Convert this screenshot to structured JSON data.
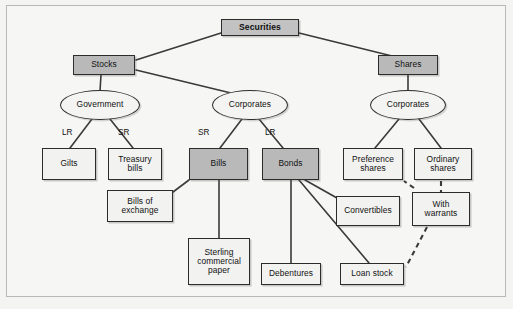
{
  "figure": {
    "background_color": "#f4f4f2",
    "frame_color": "#b9b9b4",
    "shaded_fill": "#b9b9b9",
    "plain_fill": "#f2f2f0",
    "line_color": "#3a3a3a"
  },
  "nodes": {
    "securities": {
      "label": "Securities",
      "shape": "box",
      "style": "shaded-bold",
      "x": 221,
      "y": 19,
      "w": 78,
      "h": 17
    },
    "stocks": {
      "label": "Stocks",
      "shape": "box",
      "style": "shaded",
      "x": 73,
      "y": 55,
      "w": 62,
      "h": 20
    },
    "shares": {
      "label": "Shares",
      "shape": "box",
      "style": "shaded",
      "x": 378,
      "y": 55,
      "w": 60,
      "h": 20
    },
    "government": {
      "label": "Government",
      "shape": "ellipse",
      "style": "plain",
      "x": 60,
      "y": 90,
      "w": 80,
      "h": 30
    },
    "corporates_stocks": {
      "label": "Corporates",
      "shape": "ellipse",
      "style": "plain",
      "x": 212,
      "y": 90,
      "w": 76,
      "h": 30
    },
    "corporates_shares": {
      "label": "Corporates",
      "shape": "ellipse",
      "style": "plain",
      "x": 370,
      "y": 90,
      "w": 76,
      "h": 30
    },
    "gilts": {
      "label": "Gilts",
      "shape": "box",
      "style": "plain",
      "x": 42,
      "y": 148,
      "w": 54,
      "h": 32
    },
    "treasury_bills": {
      "label": "Treasury\nbills",
      "shape": "box",
      "style": "plain",
      "x": 108,
      "y": 148,
      "w": 54,
      "h": 32
    },
    "bills": {
      "label": "Bills",
      "shape": "box",
      "style": "shaded",
      "x": 189,
      "y": 148,
      "w": 59,
      "h": 32
    },
    "bonds": {
      "label": "Bonds",
      "shape": "box",
      "style": "shaded",
      "x": 262,
      "y": 148,
      "w": 57,
      "h": 32
    },
    "preference_shares": {
      "label": "Preference\nshares",
      "shape": "box",
      "style": "plain",
      "x": 343,
      "y": 148,
      "w": 60,
      "h": 32
    },
    "ordinary_shares": {
      "label": "Ordinary\nshares",
      "shape": "box",
      "style": "plain",
      "x": 414,
      "y": 148,
      "w": 58,
      "h": 32
    },
    "bills_of_exchange": {
      "label": "Bills of\nexchange",
      "shape": "box",
      "style": "plain",
      "x": 107,
      "y": 190,
      "w": 66,
      "h": 32
    },
    "convertibles": {
      "label": "Convertibles",
      "shape": "box",
      "style": "plain",
      "x": 336,
      "y": 196,
      "w": 64,
      "h": 30
    },
    "with_warrants": {
      "label": "With\nwarrants",
      "shape": "box",
      "style": "plain",
      "x": 412,
      "y": 192,
      "w": 58,
      "h": 34
    },
    "sterling_commercial_paper": {
      "label": "Sterling\ncommercial\npaper",
      "shape": "box",
      "style": "plain",
      "x": 188,
      "y": 238,
      "w": 62,
      "h": 47
    },
    "debentures": {
      "label": "Debentures",
      "shape": "box",
      "style": "plain",
      "x": 261,
      "y": 263,
      "w": 60,
      "h": 22
    },
    "loan_stock": {
      "label": "Loan stock",
      "shape": "box",
      "style": "plain",
      "x": 340,
      "y": 263,
      "w": 64,
      "h": 22
    }
  },
  "edge_labels": {
    "gov_lr": {
      "text": "LR",
      "x": 62,
      "y": 128
    },
    "gov_sr": {
      "text": "SR",
      "x": 118,
      "y": 128
    },
    "corp_sr": {
      "text": "SR",
      "x": 198,
      "y": 128
    },
    "corp_lr": {
      "text": "LR",
      "x": 265,
      "y": 128
    }
  },
  "edges": [
    {
      "from": "securities",
      "to": "stocks",
      "style": "solid"
    },
    {
      "from": "securities",
      "to": "shares",
      "style": "solid"
    },
    {
      "from": "stocks",
      "to": "government",
      "style": "solid"
    },
    {
      "from": "stocks",
      "to": "corporates_stocks",
      "style": "solid"
    },
    {
      "from": "shares",
      "to": "corporates_shares",
      "style": "solid"
    },
    {
      "from": "government",
      "to": "gilts",
      "style": "solid",
      "label": "LR"
    },
    {
      "from": "government",
      "to": "treasury_bills",
      "style": "solid",
      "label": "SR"
    },
    {
      "from": "corporates_stocks",
      "to": "bills",
      "style": "solid",
      "label": "SR"
    },
    {
      "from": "corporates_stocks",
      "to": "bonds",
      "style": "solid",
      "label": "LR"
    },
    {
      "from": "corporates_shares",
      "to": "preference_shares",
      "style": "solid"
    },
    {
      "from": "corporates_shares",
      "to": "ordinary_shares",
      "style": "solid"
    },
    {
      "from": "bills",
      "to": "bills_of_exchange",
      "style": "solid"
    },
    {
      "from": "bills",
      "to": "sterling_commercial_paper",
      "style": "solid"
    },
    {
      "from": "bonds",
      "to": "debentures",
      "style": "solid"
    },
    {
      "from": "bonds",
      "to": "convertibles",
      "style": "solid"
    },
    {
      "from": "bonds",
      "to": "loan_stock",
      "style": "solid"
    },
    {
      "from": "ordinary_shares",
      "to": "with_warrants",
      "style": "dashed"
    },
    {
      "from": "with_warrants",
      "to": "loan_stock",
      "style": "dashed"
    }
  ]
}
